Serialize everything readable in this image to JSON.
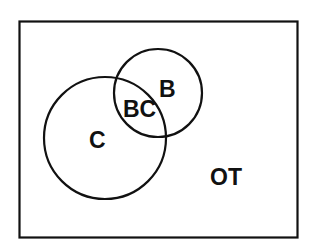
{
  "diagram": {
    "type": "venn",
    "colors": {
      "stroke": "#111111",
      "background": "#ffffff",
      "text": "#111111"
    },
    "universe": {
      "label": "OT"
    },
    "sets": [
      {
        "id": "C",
        "label": "C"
      },
      {
        "id": "B",
        "label": "B"
      }
    ],
    "intersection": {
      "label": "BC"
    }
  }
}
